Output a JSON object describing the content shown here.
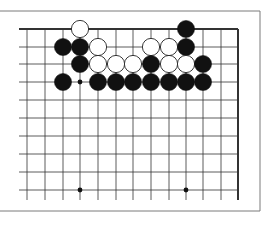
{
  "diagram": {
    "type": "go-board-fragment",
    "frame": {
      "top": 11,
      "bottom": 211,
      "right": 260,
      "color": "#7a7a7a"
    },
    "grid": {
      "columns_x": [
        27,
        45,
        63,
        80,
        98,
        116,
        133,
        151,
        169,
        186,
        203,
        221,
        238
      ],
      "rows_y": [
        29,
        47,
        64,
        82,
        100,
        118,
        136,
        154,
        172,
        190
      ],
      "line_left": 19,
      "line_bottom": 200,
      "top_edge_thick": true,
      "right_edge_thick": true,
      "line_color": "#333333"
    },
    "star_points": [
      {
        "col": 3,
        "row": 3
      },
      {
        "col": 3,
        "row": 9
      },
      {
        "col": 9,
        "row": 9
      }
    ],
    "stones": [
      {
        "col": 3,
        "row": 0,
        "color": "white"
      },
      {
        "col": 9,
        "row": 0,
        "color": "black"
      },
      {
        "col": 2,
        "row": 1,
        "color": "black"
      },
      {
        "col": 3,
        "row": 1,
        "color": "black"
      },
      {
        "col": 4,
        "row": 1,
        "color": "white"
      },
      {
        "col": 7,
        "row": 1,
        "color": "white"
      },
      {
        "col": 8,
        "row": 1,
        "color": "white"
      },
      {
        "col": 9,
        "row": 1,
        "color": "black"
      },
      {
        "col": 3,
        "row": 2,
        "color": "black"
      },
      {
        "col": 4,
        "row": 2,
        "color": "white"
      },
      {
        "col": 5,
        "row": 2,
        "color": "white"
      },
      {
        "col": 6,
        "row": 2,
        "color": "white"
      },
      {
        "col": 7,
        "row": 2,
        "color": "black"
      },
      {
        "col": 8,
        "row": 2,
        "color": "white"
      },
      {
        "col": 9,
        "row": 2,
        "color": "white"
      },
      {
        "col": 10,
        "row": 2,
        "color": "black"
      },
      {
        "col": 2,
        "row": 3,
        "color": "black"
      },
      {
        "col": 4,
        "row": 3,
        "color": "black"
      },
      {
        "col": 5,
        "row": 3,
        "color": "black"
      },
      {
        "col": 6,
        "row": 3,
        "color": "black"
      },
      {
        "col": 7,
        "row": 3,
        "color": "black"
      },
      {
        "col": 8,
        "row": 3,
        "color": "black"
      },
      {
        "col": 9,
        "row": 3,
        "color": "black"
      },
      {
        "col": 10,
        "row": 3,
        "color": "black"
      }
    ],
    "stone_radius": 8.6,
    "colors": {
      "black": "#111111",
      "white": "#ffffff",
      "white_outline": "#222222"
    }
  }
}
